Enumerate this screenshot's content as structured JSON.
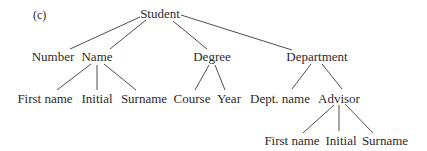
{
  "figure_label": "(c)",
  "tree": {
    "root": "Student",
    "level2": {
      "number": "Number",
      "name": "Name",
      "degree": "Degree",
      "department": "Department"
    },
    "name_children": {
      "first_name": "First name",
      "initial": "Initial",
      "surname": "Surname"
    },
    "degree_children": {
      "course": "Course",
      "year": "Year"
    },
    "department_children": {
      "dept_name": "Dept. name",
      "advisor": "Advisor"
    },
    "advisor_children": {
      "first_name": "First name",
      "initial": "Initial",
      "surname": "Surname"
    }
  },
  "colors": {
    "line": "#3a3a3a",
    "text": "#2b2b2b",
    "background": "#ffffff"
  }
}
